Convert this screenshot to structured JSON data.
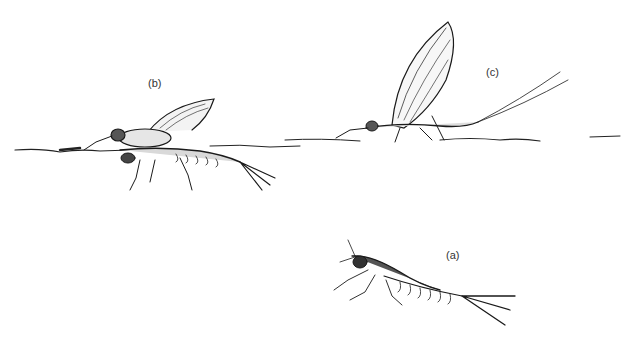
{
  "figure": {
    "labels": {
      "a": "(a)",
      "b": "(b)",
      "c": "(c)"
    },
    "panels": [
      {
        "id": "a",
        "label": "(a)",
        "subject": "nymph",
        "label_pos": [
          446,
          249
        ]
      },
      {
        "id": "b",
        "label": "(b)",
        "subject": "emerging",
        "label_pos": [
          148,
          77
        ]
      },
      {
        "id": "c",
        "label": "(c)",
        "subject": "adult",
        "label_pos": [
          486,
          66
        ]
      }
    ],
    "colors": {
      "ink": "#1a1a1a",
      "background": "#ffffff"
    }
  }
}
